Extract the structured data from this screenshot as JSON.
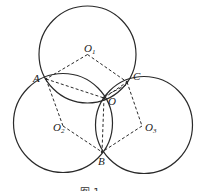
{
  "figure": {
    "caption": "图 1",
    "circles": [
      {
        "name": "O1",
        "cx": 87.5,
        "cy": 54.5,
        "r": 48.5
      },
      {
        "name": "O2",
        "cx": 63,
        "cy": 123,
        "r": 49.5
      },
      {
        "name": "O3",
        "cx": 144,
        "cy": 125,
        "r": 48.5
      }
    ],
    "points": {
      "O1": {
        "x": 87.5,
        "y": 54.5,
        "label": "O",
        "sub": "1"
      },
      "O2": {
        "x": 63,
        "y": 126,
        "label": "O",
        "sub": "2"
      },
      "O3": {
        "x": 142,
        "y": 126,
        "label": "O",
        "sub": "3"
      },
      "A": {
        "x": 46,
        "y": 79,
        "label": "A"
      },
      "B": {
        "x": 102,
        "y": 152,
        "label": "B"
      },
      "C": {
        "x": 127,
        "y": 82,
        "label": "C"
      },
      "O": {
        "x": 104,
        "y": 98,
        "label": "O"
      }
    },
    "dashed_segments": [
      [
        "O1",
        "A"
      ],
      [
        "O1",
        "C"
      ],
      [
        "A",
        "O"
      ],
      [
        "A",
        "O2"
      ],
      [
        "O2",
        "B"
      ],
      [
        "C",
        "O3"
      ],
      [
        "O3",
        "B"
      ],
      [
        "O",
        "B"
      ],
      [
        "O",
        "C"
      ]
    ],
    "colors": {
      "stroke": "#2a2a2a",
      "background": "#ffffff"
    }
  }
}
